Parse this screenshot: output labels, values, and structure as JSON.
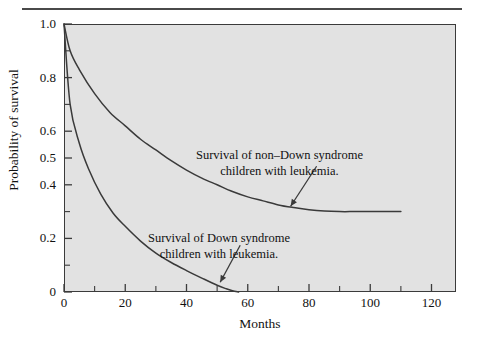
{
  "figure": {
    "background_color": "#ffffff",
    "plot_background_color": "#e2e2e2",
    "frame_color": "#3b3b3b",
    "curve_color": "#3a3a3a",
    "rule_color": "#4a4a4a",
    "text_color": "#111111"
  },
  "chart_data": {
    "type": "line",
    "title": "",
    "subtitle": "",
    "xlabel": "Months",
    "ylabel": "Probability of survival",
    "xlim": [
      0,
      128
    ],
    "ylim": [
      0,
      1.0
    ],
    "grid": false,
    "legend_position": "inline-annotations",
    "x_ticks": [
      0,
      20,
      40,
      60,
      80,
      100,
      120
    ],
    "x_tick_labels": [
      "0",
      "20",
      "40",
      "60",
      "80",
      "100",
      "120"
    ],
    "x_minor_tick_interval": 10,
    "y_ticks": [
      0,
      0.2,
      0.4,
      0.5,
      0.6,
      0.8,
      1.0
    ],
    "y_tick_labels": [
      "0",
      "0.2",
      "0.4",
      "0.5",
      "0.6",
      "0.8",
      "1.0"
    ],
    "y_minor_tick_interval": 0.1,
    "series": [
      {
        "name": "Survival of non-Down syndrome children with leukemia",
        "annotation_line1": "Survival of non–Down syndrome",
        "annotation_line2": "children with leukemia.",
        "color": "#3a3a3a",
        "x": [
          0,
          2,
          5,
          10,
          15,
          20,
          25,
          30,
          35,
          40,
          45,
          50,
          55,
          60,
          65,
          70,
          75,
          80,
          85,
          90,
          95,
          100,
          105,
          110
        ],
        "y": [
          1.0,
          0.9,
          0.83,
          0.74,
          0.67,
          0.62,
          0.57,
          0.53,
          0.49,
          0.455,
          0.425,
          0.4,
          0.375,
          0.355,
          0.34,
          0.325,
          0.315,
          0.307,
          0.302,
          0.3,
          0.3,
          0.3,
          0.3,
          0.3
        ]
      },
      {
        "name": "Survival of Down syndrome children with leukemia",
        "annotation_line1": "Survival of Down syndrome",
        "annotation_line2": "children with leukemia.",
        "color": "#3a3a3a",
        "x": [
          0,
          2,
          5,
          8,
          12,
          16,
          20,
          25,
          30,
          35,
          40,
          45,
          50,
          53,
          55,
          57
        ],
        "y": [
          1.0,
          0.7,
          0.555,
          0.46,
          0.365,
          0.295,
          0.245,
          0.19,
          0.145,
          0.11,
          0.08,
          0.052,
          0.025,
          0.012,
          0.005,
          0.0
        ]
      }
    ],
    "annotations": [
      {
        "text": "Survival of non–Down syndrome children with leukemia.",
        "points_to_x": 74,
        "points_to_y": 0.305
      },
      {
        "text": "Survival of Down syndrome children with leukemia.",
        "points_to_x": 51,
        "points_to_y": 0.025
      }
    ]
  }
}
